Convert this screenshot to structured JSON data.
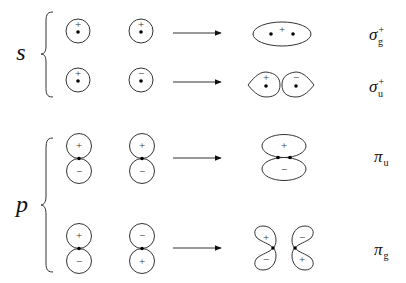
{
  "diagram": {
    "groups": [
      {
        "label": "s",
        "rows": [
          {
            "atom1_sign": "+",
            "atom2_sign": "+",
            "result_signs": [
              "+"
            ],
            "mo_symbol": "σ",
            "mo_subscript": "g",
            "mo_superscript": "+"
          },
          {
            "atom1_sign": "+",
            "atom2_sign": "−",
            "result_signs": [
              "+",
              "−"
            ],
            "mo_symbol": "σ",
            "mo_subscript": "u",
            "mo_superscript": "+"
          }
        ]
      },
      {
        "label": "p",
        "rows": [
          {
            "atom1_signs": [
              "+",
              "−"
            ],
            "atom2_signs": [
              "+",
              "−"
            ],
            "result_signs": [
              "+",
              "−"
            ],
            "mo_symbol": "π",
            "mo_subscript": "u",
            "mo_superscript": ""
          },
          {
            "atom1_signs": [
              "+",
              "−"
            ],
            "atom2_signs": [
              "−",
              "+"
            ],
            "result_signs": [
              "+",
              "−",
              "−",
              "+"
            ],
            "mo_symbol": "π",
            "mo_subscript": "g",
            "mo_superscript": ""
          }
        ]
      }
    ],
    "colors": {
      "line": "#333333",
      "dot": "#000000",
      "background": "#ffffff"
    }
  }
}
